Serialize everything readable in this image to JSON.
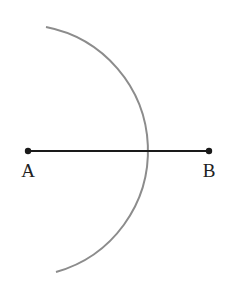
{
  "diagram": {
    "points": [
      {
        "label": "A",
        "x": 28,
        "y": 151
      },
      {
        "label": "B",
        "x": 209,
        "y": 151
      }
    ],
    "segment": {
      "from": "A",
      "to": "B",
      "color": "#1a1a1a"
    },
    "arc": {
      "start": [
        46,
        27
      ],
      "end": [
        56,
        272
      ],
      "radius": 126,
      "color": "#8c8c8c"
    }
  }
}
